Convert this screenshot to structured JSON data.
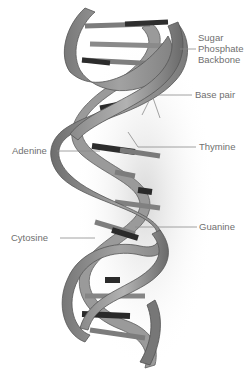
{
  "diagram": {
    "colors": {
      "strand_fill": "#8e8e8e",
      "strand_dark": "#5a5a5a",
      "strand_light": "#b4b4b4",
      "base_dark": "#2a2a2a",
      "base_grey": "#7a7a7a",
      "label_text": "#6f6f6f",
      "leader_line": "#8a8a8a",
      "background": "#ffffff"
    },
    "labels": {
      "sugar_phosphate_backbone": {
        "line1": "Sugar",
        "line2": "Phosphate",
        "line3": "Backbone"
      },
      "base_pair": "Base pair",
      "adenine": "Adenine",
      "thymine": "Thymine",
      "cytosine": "Cytosine",
      "guanine": "Guanine"
    }
  }
}
